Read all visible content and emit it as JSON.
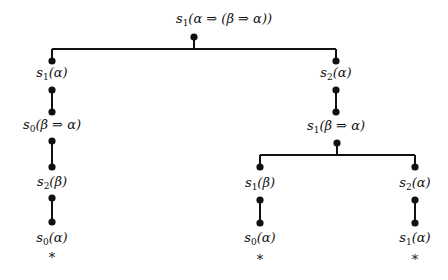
{
  "diagram": {
    "type": "proof-tree",
    "root": {
      "label": "s1(α ⇒ (β ⇒ α))",
      "base": "s",
      "sub": "1",
      "arg": "(α ⇒ (β ⇒ α))"
    },
    "nodes": [
      {
        "id": "n_root",
        "base": "s",
        "sub": "1",
        "arg": "(α ⇒ (β ⇒ α))"
      },
      {
        "id": "n_l1",
        "base": "s",
        "sub": "1",
        "arg": "(α)"
      },
      {
        "id": "n_l2",
        "base": "s",
        "sub": "0",
        "arg": "(β ⇒ α)"
      },
      {
        "id": "n_l3",
        "base": "s",
        "sub": "2",
        "arg": "(β)"
      },
      {
        "id": "n_l4",
        "base": "s",
        "sub": "0",
        "arg": "(α)"
      },
      {
        "id": "n_r1",
        "base": "s",
        "sub": "2",
        "arg": "(α)"
      },
      {
        "id": "n_r2",
        "base": "s",
        "sub": "1",
        "arg": "(β ⇒ α)"
      },
      {
        "id": "n_rl1",
        "base": "s",
        "sub": "1",
        "arg": "(β)"
      },
      {
        "id": "n_rl2",
        "base": "s",
        "sub": "0",
        "arg": "(α)"
      },
      {
        "id": "n_rr1",
        "base": "s",
        "sub": "2",
        "arg": "(α)"
      },
      {
        "id": "n_rr2",
        "base": "s",
        "sub": "1",
        "arg": "(α)"
      }
    ],
    "leaf_marker": "*",
    "line_color": "#111111"
  }
}
